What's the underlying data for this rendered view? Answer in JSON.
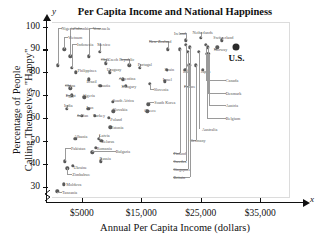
{
  "chart_data": {
    "type": "scatter",
    "title": "Per Capita Income and National Happiness",
    "xlabel": "Annual Per Capita Income (dollars)",
    "ylabel": "Percentage of People Calling Themselves \"Happy\"",
    "ylabel_line1": "Percentage of People",
    "ylabel_line2": "Calling Themselves \"Happy\"",
    "x_axis_variable": "x",
    "y_axis_variable": "y",
    "xlim": [
      0,
      40000
    ],
    "ylim": [
      25,
      102
    ],
    "grid": false,
    "legend": "none",
    "axis_break": "x-axis broken near origin",
    "xticks": [
      5000,
      15000,
      25000,
      35000
    ],
    "xtick_labels": [
      "$5000",
      "$15,000",
      "$25,000",
      "$35,000"
    ],
    "yticks": [
      30,
      40,
      50,
      60,
      70,
      80,
      90,
      100
    ],
    "ytick_labels": [
      "30",
      "40",
      "50",
      "60",
      "70",
      "80",
      "90",
      "100"
    ],
    "highlight_point": {
      "name": "U.S.",
      "x": 31000,
      "y": 91
    },
    "points": [
      {
        "name": "Nigeria",
        "x": 1000,
        "y": 83,
        "label_x": 1600,
        "label_y": 99.5,
        "anchor": "l"
      },
      {
        "name": "Colombia",
        "x": 3100,
        "y": 87,
        "label_x": 5000,
        "label_y": 99.5,
        "anchor": "c"
      },
      {
        "name": "Venezuela",
        "x": 6200,
        "y": 87,
        "label_x": 8300,
        "label_y": 99.5,
        "anchor": "c"
      },
      {
        "name": "Vietnam",
        "x": 2100,
        "y": 90,
        "label_x": 2700,
        "label_y": 95.5,
        "anchor": "l"
      },
      {
        "name": "Indonesia",
        "x": 3300,
        "y": 82,
        "label_x": 4200,
        "label_y": 92.5,
        "anchor": "l"
      },
      {
        "name": "Mexico",
        "x": 8000,
        "y": 89,
        "label_x": 7600,
        "label_y": 92.5,
        "anchor": "l"
      },
      {
        "name": "Chile",
        "x": 9000,
        "y": 84,
        "label_x": 8200,
        "label_y": 86.0,
        "anchor": "l"
      },
      {
        "name": "New Zealand",
        "x": 19500,
        "y": 90,
        "label_x": 16300,
        "label_y": 93.5,
        "anchor": "l"
      },
      {
        "name": "Czech Republic",
        "x": 13000,
        "y": 83,
        "label_x": 11600,
        "label_y": 86.0,
        "anchor": "c"
      },
      {
        "name": "Portugal",
        "x": 14800,
        "y": 82,
        "label_x": 14400,
        "label_y": 83.5,
        "anchor": "l"
      },
      {
        "name": "Philippines",
        "x": 4000,
        "y": 80,
        "label_x": 4300,
        "label_y": 81.0,
        "anchor": "l"
      },
      {
        "name": "Uruguay",
        "x": 9700,
        "y": 80,
        "label_x": 9200,
        "label_y": 81.5,
        "anchor": "l"
      },
      {
        "name": "Spain",
        "x": 19300,
        "y": 81,
        "label_x": 18900,
        "label_y": 81.5,
        "anchor": "l"
      },
      {
        "name": "Ireland",
        "x": 22500,
        "y": 94,
        "label_x": 21500,
        "label_y": 97.0,
        "anchor": "c"
      },
      {
        "name": "Netherlands",
        "x": 25000,
        "y": 95,
        "label_x": 25300,
        "label_y": 97.5,
        "anchor": "c"
      },
      {
        "name": "Switzerland",
        "x": 28500,
        "y": 94,
        "label_x": 28800,
        "label_y": 95.5,
        "anchor": "c"
      },
      {
        "name": "Norway",
        "x": 27800,
        "y": 91,
        "label_x": 27200,
        "label_y": 90.0,
        "anchor": "l"
      },
      {
        "name": "Italy",
        "x": 22400,
        "y": 81,
        "label_x": 22000,
        "label_y": 80.5,
        "anchor": "l"
      },
      {
        "name": "Japan",
        "x": 25300,
        "y": 81,
        "label_x": 25000,
        "label_y": 80.5,
        "anchor": "l"
      },
      {
        "name": "France",
        "x": 23100,
        "y": 83,
        "label_x": 22200,
        "label_y": 74.0,
        "anchor": "l"
      },
      {
        "name": "China",
        "x": 3100,
        "y": 73,
        "label_x": 2200,
        "label_y": 74.5,
        "anchor": "l"
      },
      {
        "name": "Brazil",
        "x": 6200,
        "y": 77,
        "label_x": 5800,
        "label_y": 76.0,
        "anchor": "l"
      },
      {
        "name": "Croatia",
        "x": 8100,
        "y": 74,
        "label_x": 7700,
        "label_y": 74.5,
        "anchor": "l"
      },
      {
        "name": "Argentina",
        "x": 11900,
        "y": 77,
        "label_x": 11200,
        "label_y": 77.5,
        "anchor": "l"
      },
      {
        "name": "Israel",
        "x": 19000,
        "y": 76,
        "label_x": 18600,
        "label_y": 77.0,
        "anchor": "l"
      },
      {
        "name": "Hungary",
        "x": 12400,
        "y": 74,
        "label_x": 11700,
        "label_y": 74.0,
        "anchor": "l"
      },
      {
        "name": "Slovenia",
        "x": 16400,
        "y": 75,
        "label_x": 17100,
        "label_y": 72.5,
        "anchor": "l"
      },
      {
        "name": "Egypt",
        "x": 3300,
        "y": 70,
        "label_x": 2300,
        "label_y": 70.0,
        "anchor": "l"
      },
      {
        "name": "Algeria",
        "x": 5400,
        "y": 69,
        "label_x": 5100,
        "label_y": 70.0,
        "anchor": "l"
      },
      {
        "name": "South Africa",
        "x": 10200,
        "y": 67,
        "label_x": 10200,
        "label_y": 68.0,
        "anchor": "l"
      },
      {
        "name": "South Korea",
        "x": 16200,
        "y": 66,
        "label_x": 17200,
        "label_y": 67.0,
        "anchor": "l"
      },
      {
        "name": "India",
        "x": 2500,
        "y": 64,
        "label_x": 2000,
        "label_y": 65.5,
        "anchor": "l"
      },
      {
        "name": "Iran",
        "x": 6100,
        "y": 64,
        "label_x": 5800,
        "label_y": 65.0,
        "anchor": "l"
      },
      {
        "name": "Slovakia",
        "x": 10300,
        "y": 63,
        "label_x": 10200,
        "label_y": 64.0,
        "anchor": "l"
      },
      {
        "name": "Greece",
        "x": 16000,
        "y": 63,
        "label_x": 15500,
        "label_y": 63.5,
        "anchor": "l"
      },
      {
        "name": "Jordan",
        "x": 5000,
        "y": 61,
        "label_x": 4200,
        "label_y": 61.5,
        "anchor": "l"
      },
      {
        "name": "Turkey",
        "x": 7200,
        "y": 61,
        "label_x": 6900,
        "label_y": 61.5,
        "anchor": "l"
      },
      {
        "name": "Poland",
        "x": 9500,
        "y": 60,
        "label_x": 9800,
        "label_y": 59.5,
        "anchor": "l"
      },
      {
        "name": "Estonia",
        "x": 9800,
        "y": 56,
        "label_x": 9900,
        "label_y": 56.0,
        "anchor": "l"
      },
      {
        "name": "Albania",
        "x": 3900,
        "y": 51,
        "label_x": 3700,
        "label_y": 52.0,
        "anchor": "l"
      },
      {
        "name": "Latvia",
        "x": 7900,
        "y": 51,
        "label_x": 7900,
        "label_y": 52.5,
        "anchor": "l"
      },
      {
        "name": "Belarus",
        "x": 8300,
        "y": 50,
        "label_x": 8300,
        "label_y": 50.0,
        "anchor": "l"
      },
      {
        "name": "Pakistan",
        "x": 2200,
        "y": 41,
        "label_x": 3200,
        "label_y": 47.0,
        "anchor": "l"
      },
      {
        "name": "Romania",
        "x": 7400,
        "y": 47,
        "label_x": 7500,
        "label_y": 47.0,
        "anchor": "l"
      },
      {
        "name": "Bulgaria",
        "x": 6800,
        "y": 45,
        "label_x": 10700,
        "label_y": 45.5,
        "anchor": "l"
      },
      {
        "name": "Russia",
        "x": 8200,
        "y": 41,
        "label_x": 8000,
        "label_y": 42.5,
        "anchor": "l"
      },
      {
        "name": "Ukraine",
        "x": 3500,
        "y": 39,
        "label_x": 3600,
        "label_y": 38.5,
        "anchor": "l"
      },
      {
        "name": "Zimbabwe",
        "x": 2600,
        "y": 38,
        "label_x": 3400,
        "label_y": 35.5,
        "anchor": "l"
      },
      {
        "name": "Moldova",
        "x": 2000,
        "y": 31,
        "label_x": 2400,
        "label_y": 31.0,
        "anchor": "l"
      },
      {
        "name": "Tanzania",
        "x": 900,
        "y": 28,
        "label_x": 1700,
        "label_y": 27.5,
        "anchor": "l"
      },
      {
        "name": "Australia",
        "x": 24700,
        "y": 89,
        "label_x": 25200,
        "label_y": 55.0,
        "anchor": "l"
      },
      {
        "name": "Germany",
        "x": 24200,
        "y": 83,
        "label_x": 23200,
        "label_y": 50.5,
        "anchor": "l"
      },
      {
        "name": "Finland",
        "x": 21500,
        "y": 90,
        "label_x": 20400,
        "label_y": 44.5,
        "anchor": "l"
      },
      {
        "name": "Sweden",
        "x": 22500,
        "y": 92,
        "label_x": 20400,
        "label_y": 41.0,
        "anchor": "l"
      },
      {
        "name": "Singapore",
        "x": 22800,
        "y": 89,
        "label_x": 20400,
        "label_y": 37.5,
        "anchor": "l"
      },
      {
        "name": "Britain",
        "x": 23200,
        "y": 91,
        "label_x": 20400,
        "label_y": 34.0,
        "anchor": "l"
      },
      {
        "name": "Canada",
        "x": 25900,
        "y": 92,
        "label_x": 29200,
        "label_y": 76.5,
        "anchor": "l"
      },
      {
        "name": "Denmark",
        "x": 26200,
        "y": 91,
        "label_x": 29200,
        "label_y": 71.0,
        "anchor": "l"
      },
      {
        "name": "Austria",
        "x": 26400,
        "y": 88,
        "label_x": 29200,
        "label_y": 65.5,
        "anchor": "l"
      },
      {
        "name": "Belgium",
        "x": 26100,
        "y": 88,
        "label_x": 29200,
        "label_y": 60.0,
        "anchor": "l"
      }
    ]
  }
}
